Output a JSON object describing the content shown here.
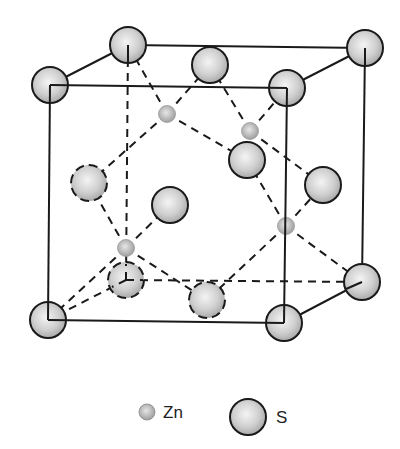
{
  "diagram": {
    "colors": {
      "line": "#1a1a1a",
      "atom_fill_center": "#f2f2f2",
      "atom_fill_edge": "#a9a9a9",
      "background": "#ffffff"
    },
    "cube": {
      "front_face": [
        [
          50,
          85
        ],
        [
          287,
          88
        ],
        [
          284,
          323
        ],
        [
          48,
          320
        ]
      ],
      "back_face": [
        [
          128,
          45
        ],
        [
          365,
          48
        ],
        [
          362,
          282
        ],
        [
          126,
          280
        ]
      ]
    },
    "atoms": {
      "S": [
        {
          "x": 50,
          "y": 85,
          "style": "solid",
          "role": "corner"
        },
        {
          "x": 128,
          "y": 45,
          "style": "solid",
          "role": "corner"
        },
        {
          "x": 365,
          "y": 48,
          "style": "solid",
          "role": "corner"
        },
        {
          "x": 287,
          "y": 88,
          "style": "solid",
          "role": "corner"
        },
        {
          "x": 48,
          "y": 320,
          "style": "solid",
          "role": "corner"
        },
        {
          "x": 284,
          "y": 323,
          "style": "solid",
          "role": "corner"
        },
        {
          "x": 362,
          "y": 282,
          "style": "solid",
          "role": "corner"
        },
        {
          "x": 126,
          "y": 280,
          "style": "dashed",
          "role": "corner"
        },
        {
          "x": 210,
          "y": 65,
          "style": "solid",
          "role": "face-center-top"
        },
        {
          "x": 89,
          "y": 183,
          "style": "dashed",
          "role": "face-center-left"
        },
        {
          "x": 170,
          "y": 205,
          "style": "solid",
          "role": "face-center-front"
        },
        {
          "x": 247,
          "y": 160,
          "style": "solid",
          "role": "face-center-back"
        },
        {
          "x": 323,
          "y": 185,
          "style": "solid",
          "role": "face-center-right"
        },
        {
          "x": 207,
          "y": 300,
          "style": "dashed",
          "role": "face-center-bottom"
        }
      ],
      "Zn": [
        {
          "x": 167,
          "y": 114
        },
        {
          "x": 250,
          "y": 131
        },
        {
          "x": 126,
          "y": 248
        },
        {
          "x": 286,
          "y": 226
        }
      ]
    },
    "bonds": [
      [
        167,
        114,
        128,
        45
      ],
      [
        167,
        114,
        210,
        65
      ],
      [
        167,
        114,
        89,
        183
      ],
      [
        167,
        114,
        247,
        160
      ],
      [
        250,
        131,
        210,
        65
      ],
      [
        250,
        131,
        287,
        88
      ],
      [
        250,
        131,
        247,
        160
      ],
      [
        250,
        131,
        323,
        185
      ],
      [
        126,
        248,
        89,
        183
      ],
      [
        126,
        248,
        170,
        205
      ],
      [
        126,
        248,
        48,
        320
      ],
      [
        126,
        248,
        207,
        300
      ],
      [
        286,
        226,
        247,
        160
      ],
      [
        286,
        226,
        323,
        185
      ],
      [
        286,
        226,
        362,
        282
      ],
      [
        286,
        226,
        207,
        300
      ]
    ],
    "hidden_edges": [
      [
        128,
        45,
        126,
        280
      ],
      [
        126,
        280,
        362,
        282
      ],
      [
        126,
        280,
        48,
        320
      ]
    ]
  },
  "legend": {
    "items": [
      {
        "label": "Zn",
        "symbol": "small-sphere"
      },
      {
        "label": "S",
        "symbol": "large-sphere"
      }
    ]
  }
}
